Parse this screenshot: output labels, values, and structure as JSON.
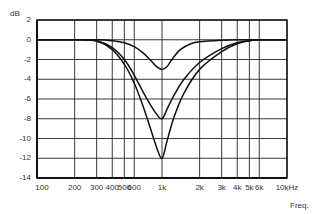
{
  "chart_data": {
    "type": "line",
    "title": "",
    "xlabel": "Freq.",
    "ylabel": "dB",
    "xscale": "log",
    "xlim": [
      100,
      10000
    ],
    "ylim": [
      -14,
      2
    ],
    "grid": true,
    "legend": null,
    "y_ticks": [
      {
        "value": 2,
        "label": "2"
      },
      {
        "value": 0,
        "label": "0"
      },
      {
        "value": -2,
        "label": "-2"
      },
      {
        "value": -4,
        "label": "-4"
      },
      {
        "value": -6,
        "label": "-6"
      },
      {
        "value": -8,
        "label": "-8"
      },
      {
        "value": -10,
        "label": "-10"
      },
      {
        "value": -12,
        "label": "-12"
      },
      {
        "value": -14,
        "label": "-14"
      }
    ],
    "x_ticks": [
      {
        "value": 100,
        "label": "100"
      },
      {
        "value": 200,
        "label": "200"
      },
      {
        "value": 300,
        "label": "300"
      },
      {
        "value": 400,
        "label": "400"
      },
      {
        "value": 500,
        "label": "500"
      },
      {
        "value": 600,
        "label": "600"
      },
      {
        "value": 1000,
        "label": "1k"
      },
      {
        "value": 2000,
        "label": "2k"
      },
      {
        "value": 3000,
        "label": "3k"
      },
      {
        "value": 4000,
        "label": "4k"
      },
      {
        "value": 5000,
        "label": "5k"
      },
      {
        "value": 6000,
        "label": "6k"
      },
      {
        "value": 10000,
        "label": "10kHz"
      }
    ],
    "series": [
      {
        "name": "notch -3 dB",
        "x": [
          200,
          300,
          400,
          500,
          600,
          700,
          800,
          900,
          1000,
          1100,
          1200,
          1400,
          1700,
          2000,
          3000,
          4000,
          6000
        ],
        "y": [
          0,
          0,
          -0.1,
          -0.3,
          -0.7,
          -1.3,
          -2.0,
          -2.7,
          -3.0,
          -2.7,
          -2.0,
          -1.0,
          -0.4,
          -0.2,
          -0.05,
          0,
          0
        ]
      },
      {
        "name": "notch -8 dB",
        "x": [
          200,
          300,
          400,
          500,
          600,
          700,
          800,
          900,
          1000,
          1100,
          1250,
          1500,
          2000,
          3000,
          4000,
          5000,
          6000
        ],
        "y": [
          0,
          -0.1,
          -0.8,
          -2.0,
          -3.6,
          -5.2,
          -6.5,
          -7.5,
          -8.0,
          -7.0,
          -5.6,
          -4.0,
          -2.3,
          -0.9,
          -0.3,
          -0.1,
          0
        ]
      },
      {
        "name": "notch -12 dB",
        "x": [
          200,
          300,
          400,
          500,
          600,
          700,
          800,
          900,
          1000,
          1100,
          1250,
          1500,
          2000,
          3000,
          4000,
          5000,
          6000
        ],
        "y": [
          0,
          -0.15,
          -1.0,
          -2.5,
          -4.4,
          -6.6,
          -8.8,
          -10.8,
          -12.0,
          -10.2,
          -7.8,
          -5.4,
          -3.0,
          -1.2,
          -0.4,
          -0.1,
          0
        ]
      }
    ]
  },
  "labels": {
    "ylabel": "dB",
    "xlabel": "Freq."
  }
}
